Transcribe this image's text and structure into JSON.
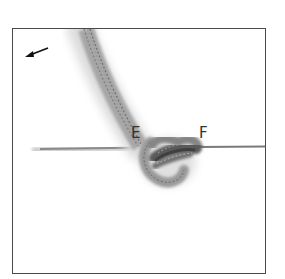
{
  "figure": {
    "labels": {
      "e": "E",
      "f": "F"
    },
    "arrow_direction": "down-left",
    "colors": {
      "frame": "#4a4a4a",
      "rope_dark": "#555555",
      "rope_mid": "#8a8a8a",
      "rope_light": "#bdbdbd",
      "label": "#333333",
      "background": "#ffffff"
    }
  }
}
